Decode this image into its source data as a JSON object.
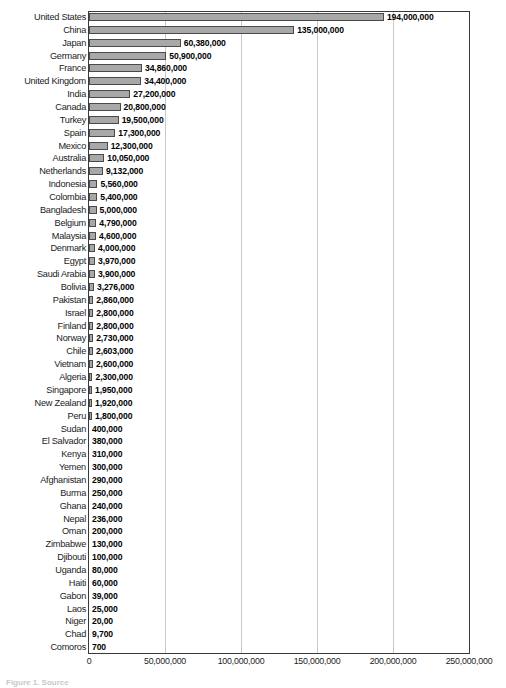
{
  "chart_data": {
    "type": "bar",
    "orientation": "horizontal",
    "title": "",
    "subtitle": "",
    "xlabel": "",
    "ylabel": "",
    "xlim": [
      0,
      250000000
    ],
    "grid": true,
    "legend": null,
    "legend_position": "none",
    "tick_labels": [
      "0",
      "50,000,000",
      "100,000,000",
      "150,000,000",
      "200,000,000",
      "250,000,000"
    ],
    "tick_values": [
      0,
      50000000,
      100000000,
      150000000,
      200000000,
      250000000
    ],
    "categories": [
      "United States",
      "China",
      "Japan",
      "Germany",
      "France",
      "United Kingdom",
      "India",
      "Canada",
      "Turkey",
      "Spain",
      "Mexico",
      "Australia",
      "Netherlands",
      "Indonesia",
      "Colombia",
      "Bangladesh",
      "Belgium",
      "Malaysia",
      "Denmark",
      "Egypt",
      "Saudi Arabia",
      "Bolivia",
      "Pakistan",
      "Israel",
      "Finland",
      "Norway",
      "Chile",
      "Vietnam",
      "Algeria",
      "Singapore",
      "New Zealand",
      "Peru",
      "Sudan",
      "El Salvador",
      "Kenya",
      "Yemen",
      "Afghanistan",
      "Burma",
      "Ghana",
      "Nepal",
      "Oman",
      "Zimbabwe",
      "Djibouti",
      "Uganda",
      "Haiti",
      "Gabon",
      "Laos",
      "Niger",
      "Chad",
      "Comoros"
    ],
    "values": [
      194000000,
      135000000,
      60380000,
      50900000,
      34860000,
      34400000,
      27200000,
      20800000,
      19500000,
      17300000,
      12300000,
      10050000,
      9132000,
      5560000,
      5400000,
      5000000,
      4790000,
      4600000,
      4000000,
      3970000,
      3900000,
      3276000,
      2860000,
      2800000,
      2800000,
      2730000,
      2603000,
      2600000,
      2300000,
      1950000,
      1920000,
      1800000,
      400000,
      380000,
      310000,
      300000,
      290000,
      250000,
      240000,
      236000,
      200000,
      130000,
      100000,
      80000,
      60000,
      39000,
      25000,
      20000,
      9700,
      700
    ],
    "value_labels": [
      "194,000,000",
      "135,000,000",
      "60,380,000",
      "50,900,000",
      "34,860,000",
      "34,400,000",
      "27,200,000",
      "20,800,000",
      "19,500,000",
      "17,300,000",
      "12,300,000",
      "10,050,000",
      "9,132,000",
      "5,560,000",
      "5,400,000",
      "5,000,000",
      "4,790,000",
      "4,600,000",
      "4,000,000",
      "3,970,000",
      "3,900,000",
      "3,276,000",
      "2,860,000",
      "2,800,000",
      "2,800,000",
      "2,730,000",
      "2,603,000",
      "2,600,000",
      "2,300,000",
      "1,950,000",
      "1,920,000",
      "1,800,000",
      "400,000",
      "380,000",
      "310,000",
      "300,000",
      "290,000",
      "250,000",
      "240,000",
      "236,000",
      "200,000",
      "130,000",
      "100,000",
      "80,000",
      "60,000",
      "39,000",
      "25,000",
      "20,00",
      "9,700",
      "700"
    ],
    "bar_color": "#a8a8a8",
    "bar_border_color": "#4a4a4a",
    "grid_color": "#c9c9c9",
    "axis_color": "#3a3a3a"
  },
  "caption": "Figure 1. Source"
}
